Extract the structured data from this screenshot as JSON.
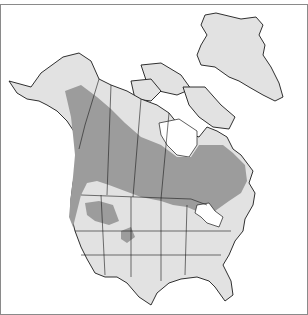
{
  "map": {
    "type": "species range map",
    "region": "North America",
    "legend": [
      {
        "label": "range",
        "color": "#9c9c9c"
      },
      {
        "label": "land",
        "color": "#e2e2e2"
      },
      {
        "label": "water",
        "color": "#ffffff"
      }
    ],
    "colors": {
      "range": "#9c9c9c",
      "land": "#e2e2e2",
      "water": "#ffffff",
      "outline": "#1a1a1a",
      "frame": "#8a8a8a"
    }
  }
}
